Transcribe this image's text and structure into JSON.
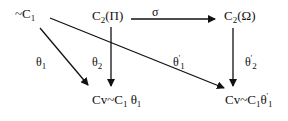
{
  "nodes": {
    "top_left": {
      "prefix": "~C",
      "sub": "1"
    },
    "top_mid": {
      "prefix": "C",
      "sub": "2",
      "suffix": "(Π)"
    },
    "top_right": {
      "prefix": "C",
      "sub": "2",
      "suffix": "(Ω)"
    },
    "bot_left": {
      "prefix": "Cv~C",
      "sub": "1",
      "mid": " θ",
      "sub2": "1"
    },
    "bot_right": {
      "prefix": "Cv~C",
      "sub": "1",
      "mid": "θ",
      "sup": "'",
      "sub2": "1"
    }
  },
  "edges": {
    "sigma": {
      "label": "σ"
    },
    "theta1": {
      "label": "θ",
      "sub": "1"
    },
    "theta2": {
      "label": "θ",
      "sub": "2"
    },
    "theta1p": {
      "label": "θ",
      "sup": "'",
      "sub": "1"
    },
    "theta2p": {
      "label": "θ",
      "sup": "'",
      "sub": "2"
    }
  },
  "colors": {
    "ink": "#111111",
    "background": "#ffffff"
  }
}
